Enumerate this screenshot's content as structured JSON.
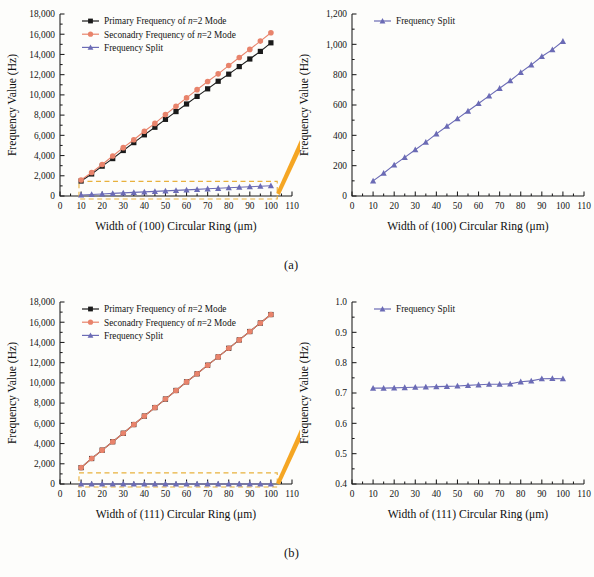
{
  "figure": {
    "subcaptions": [
      "(a)",
      "(b)"
    ],
    "colors": {
      "primary": "#1a1a1a",
      "secondary": "#e8836b",
      "split": "#6b6bb5",
      "callout": "#f5a623",
      "dashbox": "#e8b13d",
      "axis": "#1b1b1b"
    }
  },
  "panels": [
    {
      "id": "a-left",
      "axis": {
        "xlabel": "Width of (100) Circular Ring (μm)",
        "ylabel": "Frequency Value (Hz)",
        "xticks": [
          "0",
          "10",
          "20",
          "30",
          "40",
          "50",
          "60",
          "70",
          "80",
          "90",
          "100",
          "110"
        ],
        "yticks": [
          "0",
          "2,000",
          "4,000",
          "6,000",
          "8,000",
          "10,000",
          "12,000",
          "14,000",
          "16,000",
          "18,000"
        ],
        "xlim": [
          0,
          110
        ],
        "ylim": [
          0,
          18000
        ]
      },
      "legend": [
        {
          "label_pre": "Primary Frequency of ",
          "label_it": "n",
          "label_post": "=2 Mode",
          "marker": "square",
          "color": "#1a1a1a"
        },
        {
          "label_pre": "Seconadry Frequency of ",
          "label_it": "n",
          "label_post": "=2 Mode",
          "marker": "circle",
          "color": "#e8836b"
        },
        {
          "label_pre": "Frequency Split",
          "label_it": "",
          "label_post": "",
          "marker": "triangle",
          "color": "#6b6bb5"
        }
      ],
      "callout": {
        "type": "dashed-box-with-arrow",
        "box_x": [
          9,
          103
        ],
        "box_y": [
          -300,
          1450
        ]
      }
    },
    {
      "id": "a-right",
      "axis": {
        "xlabel": "Width of (100) Circular Ring (μm)",
        "ylabel": "Frequency Value (Hz)",
        "xticks": [
          "0",
          "10",
          "20",
          "30",
          "40",
          "50",
          "60",
          "70",
          "80",
          "90",
          "100",
          "110"
        ],
        "yticks": [
          "0",
          "200",
          "400",
          "600",
          "800",
          "1,000",
          "1,200"
        ],
        "xlim": [
          0,
          110
        ],
        "ylim": [
          0,
          1200
        ]
      },
      "legend": [
        {
          "label_pre": "Frequency Split",
          "label_it": "",
          "label_post": "",
          "marker": "triangle",
          "color": "#6b6bb5"
        }
      ],
      "callout": null
    },
    {
      "id": "b-left",
      "axis": {
        "xlabel": "Width of (111) Circular Ring (μm)",
        "ylabel": "Frequency Value (Hz)",
        "xticks": [
          "0",
          "10",
          "20",
          "30",
          "40",
          "50",
          "60",
          "70",
          "80",
          "90",
          "100",
          "110"
        ],
        "yticks": [
          "0",
          "2,000",
          "4,000",
          "6,000",
          "8,000",
          "10,000",
          "12,000",
          "14,000",
          "16,000",
          "18,000"
        ],
        "xlim": [
          0,
          110
        ],
        "ylim": [
          0,
          18000
        ]
      },
      "legend": [
        {
          "label_pre": "Primary Frequency of ",
          "label_it": "n",
          "label_post": "=2 Mode",
          "marker": "square",
          "color": "#1a1a1a"
        },
        {
          "label_pre": "Seconadry Frequency of ",
          "label_it": "n",
          "label_post": "=2 Mode",
          "marker": "circle",
          "color": "#e8836b"
        },
        {
          "label_pre": "Frequency Split",
          "label_it": "",
          "label_post": "",
          "marker": "triangle",
          "color": "#6b6bb5"
        }
      ],
      "callout": {
        "type": "dashed-box-with-arrow",
        "box_x": [
          9,
          103
        ],
        "box_y": [
          -300,
          1100
        ]
      }
    },
    {
      "id": "b-right",
      "axis": {
        "xlabel": "Width of (111) Circular Ring (μm)",
        "ylabel": "Frequency Value (Hz)",
        "xticks": [
          "0",
          "10",
          "20",
          "30",
          "40",
          "50",
          "60",
          "70",
          "80",
          "90",
          "100",
          "110"
        ],
        "yticks": [
          "0.4",
          "0.5",
          "0.6",
          "0.7",
          "0.8",
          "0.9",
          "1.0"
        ],
        "xlim": [
          0,
          110
        ],
        "ylim": [
          0.4,
          1.0
        ]
      },
      "legend": [
        {
          "label_pre": "Frequency Split",
          "label_it": "",
          "label_post": "",
          "marker": "triangle",
          "color": "#6b6bb5"
        }
      ],
      "callout": null
    }
  ],
  "chart_data": [
    {
      "id": "a-left",
      "type": "line",
      "title": "",
      "xlabel": "Width of (100) Circular Ring (μm)",
      "ylabel": "Frequency Value (Hz)",
      "xlim": [
        0,
        110
      ],
      "ylim": [
        0,
        18000
      ],
      "grid": false,
      "legend_position": "top-left",
      "x": [
        10,
        15,
        20,
        25,
        30,
        35,
        40,
        45,
        50,
        55,
        60,
        65,
        70,
        75,
        80,
        85,
        90,
        95,
        100
      ],
      "series": [
        {
          "name": "Primary Frequency of n=2 Mode",
          "marker": "square",
          "color": "#1a1a1a",
          "values": [
            1480,
            2180,
            2950,
            3700,
            4500,
            5280,
            6050,
            6800,
            7580,
            8350,
            9100,
            9850,
            10600,
            11350,
            12050,
            12800,
            13550,
            14300,
            15150
          ]
        },
        {
          "name": "Seconadry Frequency of n=2 Mode",
          "marker": "circle",
          "color": "#e8836b",
          "values": [
            1580,
            2330,
            3120,
            3960,
            4780,
            5560,
            6400,
            7180,
            8050,
            8880,
            9700,
            10520,
            11320,
            12080,
            12900,
            13700,
            14500,
            15320,
            16150
          ]
        },
        {
          "name": "Frequency Split",
          "marker": "triangle",
          "color": "#6b6bb5",
          "values": [
            100,
            150,
            205,
            255,
            305,
            355,
            410,
            460,
            510,
            560,
            610,
            660,
            710,
            760,
            815,
            865,
            920,
            965,
            1020
          ]
        }
      ]
    },
    {
      "id": "a-right",
      "type": "line",
      "title": "",
      "xlabel": "Width of (100) Circular Ring (μm)",
      "ylabel": "Frequency Value (Hz)",
      "xlim": [
        0,
        110
      ],
      "ylim": [
        0,
        1200
      ],
      "grid": false,
      "legend_position": "top-left",
      "x": [
        10,
        15,
        20,
        25,
        30,
        35,
        40,
        45,
        50,
        55,
        60,
        65,
        70,
        75,
        80,
        85,
        90,
        95,
        100
      ],
      "series": [
        {
          "name": "Frequency Split",
          "marker": "triangle",
          "color": "#6b6bb5",
          "values": [
            100,
            150,
            205,
            255,
            305,
            355,
            410,
            460,
            510,
            560,
            610,
            660,
            710,
            760,
            815,
            865,
            920,
            965,
            1020
          ]
        }
      ]
    },
    {
      "id": "b-left",
      "type": "line",
      "title": "",
      "xlabel": "Width of (111) Circular Ring (μm)",
      "ylabel": "Frequency Value (Hz)",
      "xlim": [
        0,
        110
      ],
      "ylim": [
        0,
        18000
      ],
      "grid": false,
      "legend_position": "top-left",
      "x": [
        10,
        15,
        20,
        25,
        30,
        35,
        40,
        45,
        50,
        55,
        60,
        65,
        70,
        75,
        80,
        85,
        90,
        95,
        100
      ],
      "series": [
        {
          "name": "Primary Frequency of n=2 Mode",
          "marker": "square",
          "color": "#1a1a1a",
          "values": [
            1620,
            2520,
            3350,
            4180,
            5020,
            5880,
            6720,
            7560,
            8400,
            9250,
            10100,
            10900,
            11750,
            12570,
            13420,
            14250,
            15080,
            15920,
            16760
          ]
        },
        {
          "name": "Seconadry Frequency of n=2 Mode",
          "marker": "circle",
          "color": "#e8836b",
          "values": [
            1620,
            2520,
            3350,
            4180,
            5020,
            5880,
            6720,
            7560,
            8400,
            9250,
            10100,
            10900,
            11750,
            12570,
            13420,
            14250,
            15080,
            15920,
            16760
          ]
        },
        {
          "name": "Frequency Split",
          "marker": "triangle",
          "color": "#6b6bb5",
          "values": [
            0.716,
            0.716,
            0.717,
            0.718,
            0.719,
            0.72,
            0.721,
            0.722,
            0.723,
            0.725,
            0.727,
            0.729,
            0.729,
            0.73,
            0.737,
            0.74,
            0.747,
            0.748,
            0.747
          ]
        }
      ]
    },
    {
      "id": "b-right",
      "type": "line",
      "title": "",
      "xlabel": "Width of (111) Circular Ring (μm)",
      "ylabel": "Frequency Value (Hz)",
      "xlim": [
        0,
        110
      ],
      "ylim": [
        0.4,
        1.0
      ],
      "grid": false,
      "legend_position": "top-left",
      "x": [
        10,
        15,
        20,
        25,
        30,
        35,
        40,
        45,
        50,
        55,
        60,
        65,
        70,
        75,
        80,
        85,
        90,
        95,
        100
      ],
      "series": [
        {
          "name": "Frequency Split",
          "marker": "triangle",
          "color": "#6b6bb5",
          "values": [
            0.716,
            0.716,
            0.717,
            0.718,
            0.719,
            0.72,
            0.721,
            0.722,
            0.723,
            0.725,
            0.727,
            0.729,
            0.729,
            0.73,
            0.737,
            0.74,
            0.747,
            0.748,
            0.747
          ]
        }
      ]
    }
  ]
}
